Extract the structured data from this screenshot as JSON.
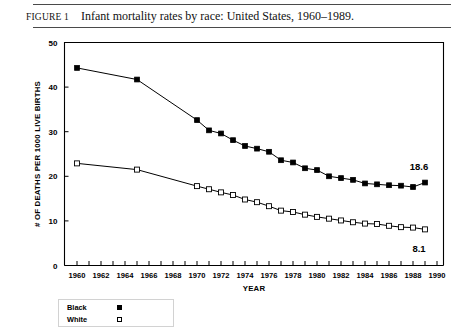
{
  "figure": {
    "label": "FIGURE 1",
    "title": "Infant mortality rates by race: United States, 1960–1989."
  },
  "legend": {
    "items": [
      {
        "label": "Black",
        "marker": "filled-square"
      },
      {
        "label": "White",
        "marker": "open-square"
      }
    ]
  },
  "chart_data": {
    "type": "line",
    "title": "Infant mortality rates by race: United States, 1960–1989.",
    "xlabel": "YEAR",
    "ylabel": "# OF DEATHS PER 1000 LIVE BIRTHS",
    "xlim": [
      1960,
      1990
    ],
    "ylim": [
      0,
      50
    ],
    "yticks": [
      0,
      10,
      20,
      30,
      40,
      50
    ],
    "ytick_labels": [
      "0",
      "10",
      "20",
      "30",
      "40",
      "50"
    ],
    "xticks": [
      1960,
      1961,
      1962,
      1963,
      1964,
      1965,
      1966,
      1967,
      1968,
      1969,
      1970,
      1971,
      1972,
      1973,
      1974,
      1975,
      1976,
      1977,
      1978,
      1979,
      1980,
      1981,
      1982,
      1983,
      1984,
      1985,
      1986,
      1987,
      1988,
      1989,
      1990
    ],
    "xtick_labels": [
      "1960",
      "1962",
      "1964",
      "1966",
      "1968",
      "1970",
      "1972",
      "1974",
      "1976",
      "1978",
      "1980",
      "1982",
      "1984",
      "1986",
      "1988",
      "1990"
    ],
    "xtick_label_years": [
      1960,
      1962,
      1964,
      1966,
      1968,
      1970,
      1972,
      1974,
      1976,
      1978,
      1980,
      1982,
      1984,
      1986,
      1988,
      1990
    ],
    "grid": false,
    "legend_position": "below-left",
    "series": [
      {
        "name": "Black",
        "marker": "filled-square",
        "x": [
          1960,
          1965,
          1970,
          1971,
          1972,
          1973,
          1974,
          1975,
          1976,
          1977,
          1978,
          1979,
          1980,
          1981,
          1982,
          1983,
          1984,
          1985,
          1986,
          1987,
          1988,
          1989
        ],
        "values": [
          44.3,
          41.7,
          32.6,
          30.3,
          29.6,
          28.1,
          26.8,
          26.2,
          25.5,
          23.6,
          23.1,
          21.8,
          21.4,
          20.0,
          19.6,
          19.2,
          18.4,
          18.2,
          18.0,
          17.9,
          17.6,
          18.6
        ]
      },
      {
        "name": "White",
        "marker": "open-square",
        "x": [
          1960,
          1965,
          1970,
          1971,
          1972,
          1973,
          1974,
          1975,
          1976,
          1977,
          1978,
          1979,
          1980,
          1981,
          1982,
          1983,
          1984,
          1985,
          1986,
          1987,
          1988,
          1989
        ],
        "values": [
          22.9,
          21.5,
          17.8,
          17.1,
          16.4,
          15.8,
          14.8,
          14.2,
          13.3,
          12.3,
          12.0,
          11.4,
          10.9,
          10.5,
          10.1,
          9.7,
          9.4,
          9.3,
          8.9,
          8.6,
          8.5,
          8.1
        ]
      }
    ],
    "annotations": [
      {
        "text": "18.6",
        "series": "Black",
        "x": 1989,
        "value": 18.6
      },
      {
        "text": "8.1",
        "series": "White",
        "x": 1989,
        "value": 8.1
      }
    ]
  }
}
